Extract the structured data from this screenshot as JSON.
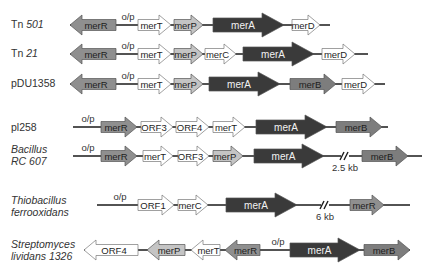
{
  "colors": {
    "merR": "#8f8f8f",
    "merA": "#3a3a3a",
    "merB": "#7d7d7d",
    "merP": "#c4c4c4",
    "white": "#ffffff",
    "line": "#1a1a1a",
    "text_dark_gene": "#1e1e1e",
    "text_light_gene": "#f2f2f2"
  },
  "rows": [
    {
      "name": "Tn 501",
      "prefix": "Tn ",
      "italic": "501",
      "y": 25,
      "line": [
        70,
        330
      ],
      "op": {
        "label": "o/p",
        "x": 128
      },
      "genes": [
        {
          "label": "merR",
          "x1": 70,
          "x2": 116,
          "dir": "left",
          "type": "merR"
        },
        {
          "label": "merT",
          "x1": 138,
          "x2": 171,
          "dir": "right",
          "type": "white"
        },
        {
          "label": "merP",
          "x1": 174,
          "x2": 203,
          "dir": "right",
          "type": "merP"
        },
        {
          "label": "merA",
          "x1": 213,
          "x2": 284,
          "dir": "right",
          "type": "merA"
        },
        {
          "label": "merD",
          "x1": 292,
          "x2": 320,
          "dir": "right",
          "type": "white"
        }
      ]
    },
    {
      "name": "Tn 21",
      "prefix": "Tn ",
      "italic": "21",
      "y": 54,
      "line": [
        70,
        368
      ],
      "op": {
        "label": "o/p",
        "x": 128
      },
      "genes": [
        {
          "label": "merR",
          "x1": 70,
          "x2": 116,
          "dir": "left",
          "type": "merR"
        },
        {
          "label": "merT",
          "x1": 138,
          "x2": 171,
          "dir": "right",
          "type": "white"
        },
        {
          "label": "merP",
          "x1": 174,
          "x2": 203,
          "dir": "right",
          "type": "merP"
        },
        {
          "label": "merC",
          "x1": 205,
          "x2": 236,
          "dir": "right",
          "type": "white"
        },
        {
          "label": "merA",
          "x1": 243,
          "x2": 314,
          "dir": "right",
          "type": "merA"
        },
        {
          "label": "merD",
          "x1": 322,
          "x2": 355,
          "dir": "right",
          "type": "white"
        }
      ]
    },
    {
      "name": "pDU1358",
      "prefix": "pDU1358",
      "italic": "",
      "y": 84,
      "line": [
        70,
        385
      ],
      "op": {
        "label": "o/p",
        "x": 128
      },
      "genes": [
        {
          "label": "merR",
          "x1": 70,
          "x2": 116,
          "dir": "left",
          "type": "merR"
        },
        {
          "label": "merT",
          "x1": 138,
          "x2": 171,
          "dir": "right",
          "type": "white"
        },
        {
          "label": "merP",
          "x1": 174,
          "x2": 203,
          "dir": "right",
          "type": "merP"
        },
        {
          "label": "merA",
          "x1": 209,
          "x2": 280,
          "dir": "right",
          "type": "merA"
        },
        {
          "label": "merB",
          "x1": 290,
          "x2": 336,
          "dir": "right",
          "type": "merB"
        },
        {
          "label": "merD",
          "x1": 342,
          "x2": 375,
          "dir": "right",
          "type": "white"
        }
      ]
    },
    {
      "name": "pl258",
      "prefix": "pl258",
      "italic": "",
      "y": 127,
      "line": [
        73,
        388
      ],
      "op": {
        "label": "o/p",
        "x": 88
      },
      "genes": [
        {
          "label": "merR",
          "x1": 101,
          "x2": 137,
          "dir": "right",
          "type": "merR"
        },
        {
          "label": "ORF3",
          "x1": 141,
          "x2": 173,
          "dir": "right",
          "type": "white"
        },
        {
          "label": "ORF4",
          "x1": 176,
          "x2": 209,
          "dir": "right",
          "type": "white"
        },
        {
          "label": "merT",
          "x1": 213,
          "x2": 245,
          "dir": "right",
          "type": "white"
        },
        {
          "label": "merA",
          "x1": 256,
          "x2": 327,
          "dir": "right",
          "type": "merA"
        },
        {
          "label": "merB",
          "x1": 336,
          "x2": 382,
          "dir": "right",
          "type": "merB"
        }
      ]
    },
    {
      "name": "Bacillus RC 607",
      "line1": "Bacillus",
      "line2": "RC 607",
      "y": 156,
      "line": [
        73,
        422
      ],
      "op": {
        "label": "o/p",
        "x": 88
      },
      "break": {
        "x": 345,
        "label": "2.5 kb"
      },
      "genes": [
        {
          "label": "merR",
          "x1": 101,
          "x2": 137,
          "dir": "right",
          "type": "merR"
        },
        {
          "label": "merT",
          "x1": 143,
          "x2": 173,
          "dir": "right",
          "type": "white"
        },
        {
          "label": "ORF3",
          "x1": 178,
          "x2": 209,
          "dir": "right",
          "type": "white"
        },
        {
          "label": "merP",
          "x1": 213,
          "x2": 243,
          "dir": "right",
          "type": "merP"
        },
        {
          "label": "merA",
          "x1": 254,
          "x2": 324,
          "dir": "right",
          "type": "merA"
        },
        {
          "label": "merB",
          "x1": 362,
          "x2": 408,
          "dir": "right",
          "type": "merB"
        }
      ]
    },
    {
      "name": "Thiobacillus ferrooxidans",
      "line1": "Thiobacillus",
      "line2": "ferrooxidans",
      "y": 205,
      "line": [
        97,
        410
      ],
      "op": {
        "label": "o/p",
        "x": 120
      },
      "break": {
        "x": 325,
        "label": "6 kb"
      },
      "genes": [
        {
          "label": "ORF1",
          "x1": 138,
          "x2": 174,
          "dir": "right",
          "type": "white"
        },
        {
          "label": "merC",
          "x1": 178,
          "x2": 208,
          "dir": "right",
          "type": "white"
        },
        {
          "label": "merA",
          "x1": 226,
          "x2": 297,
          "dir": "right",
          "type": "merA"
        },
        {
          "label": "merR",
          "x1": 350,
          "x2": 384,
          "dir": "right",
          "type": "merR"
        }
      ]
    },
    {
      "name": "Streptomyces lividans 1326",
      "line1": "Streptomyces",
      "line2": "lividans 1326",
      "y": 250,
      "line": [
        84,
        410
      ],
      "op": {
        "label": "o/p",
        "x": 278
      },
      "genes": [
        {
          "label": "ORF4",
          "x1": 84,
          "x2": 138,
          "dir": "left",
          "type": "white"
        },
        {
          "label": "merP",
          "x1": 147,
          "x2": 185,
          "dir": "left",
          "type": "merP"
        },
        {
          "label": "merT",
          "x1": 191,
          "x2": 220,
          "dir": "left",
          "type": "white"
        },
        {
          "label": "merR",
          "x1": 225,
          "x2": 260,
          "dir": "left",
          "type": "merR"
        },
        {
          "label": "merA",
          "x1": 290,
          "x2": 360,
          "dir": "right",
          "type": "merA"
        },
        {
          "label": "merB",
          "x1": 364,
          "x2": 410,
          "dir": "right",
          "type": "merB"
        }
      ]
    }
  ]
}
